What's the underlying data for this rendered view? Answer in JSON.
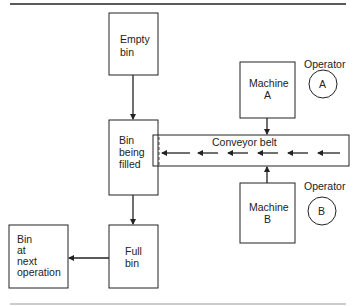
{
  "diagram": {
    "nodes": {
      "empty_bin": {
        "label_lines": [
          "Empty",
          "bin"
        ]
      },
      "bin_filling": {
        "label_lines": [
          "Bin",
          "being",
          "filled"
        ]
      },
      "full_bin": {
        "label_lines": [
          "Full",
          "bin"
        ]
      },
      "next_bin": {
        "label_lines": [
          "Bin",
          "at",
          "next",
          "operation"
        ]
      },
      "machine_a": {
        "label_lines": [
          "Machine",
          "A"
        ]
      },
      "machine_b": {
        "label_lines": [
          "Machine",
          "B"
        ]
      },
      "conveyor": {
        "label": "Conveyor belt"
      },
      "operator_a": {
        "caption": "Operator",
        "letter": "A"
      },
      "operator_b": {
        "caption": "Operator",
        "letter": "B"
      }
    },
    "edges": [
      {
        "from": "Empty bin",
        "to": "Bin being filled"
      },
      {
        "from": "Bin being filled",
        "to": "Full bin"
      },
      {
        "from": "Full bin",
        "to": "Bin at next operation"
      },
      {
        "from": "Machine A",
        "to": "Conveyor belt"
      },
      {
        "from": "Machine B",
        "to": "Conveyor belt"
      },
      {
        "from": "Conveyor belt",
        "to": "Bin being filled"
      }
    ],
    "colors": {
      "line": "#222222",
      "background": "#ffffff"
    }
  }
}
